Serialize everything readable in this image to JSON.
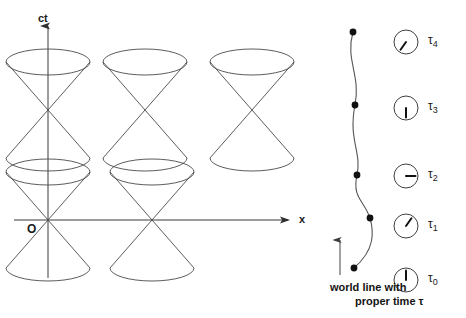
{
  "figure": {
    "kind": "minkowski-spacetime-diagram",
    "background_color": "#ffffff",
    "line_color": "#4a4a4a",
    "axis_color": "#3a3a3a",
    "text_color": "#1a1a1a",
    "width": 466,
    "height": 318
  },
  "axes": {
    "vertical_label": "ct",
    "horizontal_label": "x",
    "origin_label": "O",
    "origin_point": {
      "x": 48,
      "y": 220
    },
    "vertical": {
      "x": 48,
      "y_top": 26,
      "y_bottom": 278
    },
    "horizontal": {
      "y": 220,
      "x_left": 14,
      "x_right": 288
    }
  },
  "light_cones": {
    "count": 5,
    "rx": 42,
    "ry": 13,
    "half_height": 48,
    "centers": [
      {
        "id": "cone-top-left",
        "x": 48,
        "y": 110
      },
      {
        "id": "cone-top-middle",
        "x": 145,
        "y": 110
      },
      {
        "id": "cone-top-right",
        "x": 252,
        "y": 110
      },
      {
        "id": "cone-bottom-left",
        "x": 48,
        "y": 220
      },
      {
        "id": "cone-bottom-middle",
        "x": 152,
        "y": 220
      }
    ]
  },
  "world_line": {
    "path": "M 354,268 C 375,250 374,232 370,218 C 364,200 352,198 357,175 C 362,152 348,140 355,105 C 361,75 345,60 353,32",
    "events": [
      {
        "label": "tau0",
        "x": 354,
        "y": 268
      },
      {
        "label": "tau1",
        "x": 370,
        "y": 218
      },
      {
        "label": "tau2",
        "x": 357,
        "y": 175
      },
      {
        "label": "tau3",
        "x": 355,
        "y": 105
      },
      {
        "label": "tau4",
        "x": 353,
        "y": 32
      }
    ],
    "direction_arrow": {
      "x": 340,
      "y_bottom": 275,
      "y_top": 240
    }
  },
  "clocks": [
    {
      "name": "tau4",
      "label": "τ",
      "subscript": "4",
      "cx": 406,
      "cy": 42,
      "r": 12,
      "hand_angle_deg": 215
    },
    {
      "name": "tau3",
      "label": "τ",
      "subscript": "3",
      "cx": 406,
      "cy": 108,
      "r": 12,
      "hand_angle_deg": 180
    },
    {
      "name": "tau2",
      "label": "τ",
      "subscript": "2",
      "cx": 406,
      "cy": 176,
      "r": 12,
      "hand_angle_deg": 90
    },
    {
      "name": "tau1",
      "label": "τ",
      "subscript": "1",
      "cx": 406,
      "cy": 226,
      "r": 12,
      "hand_angle_deg": 35
    },
    {
      "name": "tau0",
      "label": "τ",
      "subscript": "0",
      "cx": 406,
      "cy": 280,
      "r": 12,
      "hand_angle_deg": 0
    }
  ],
  "caption": {
    "line1": "world line with",
    "line2": "proper time τ",
    "line1_pos": {
      "x": 330,
      "y": 281
    },
    "line2_pos": {
      "x": 355,
      "y": 295
    }
  }
}
